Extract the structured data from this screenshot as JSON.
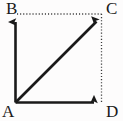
{
  "figure": {
    "name": "vector-parallelogram-diagram",
    "width": 123,
    "height": 121,
    "background_color": "#fdfcfc",
    "stroke_color": "#1a1a1a"
  },
  "labels": {
    "a": "A",
    "b": "B",
    "c": "C",
    "d": "D"
  },
  "points": {
    "a": {
      "name": "A",
      "x": 15,
      "y": 102
    },
    "b": {
      "name": "B",
      "x": 15,
      "y": 14
    },
    "c": {
      "name": "C",
      "x": 101,
      "y": 14
    },
    "d": {
      "name": "D",
      "x": 101,
      "y": 102
    }
  },
  "vectors": [
    {
      "name": "vector-ab",
      "from": "A",
      "to": "B",
      "style": "solid-arrow",
      "direction": "up"
    },
    {
      "name": "vector-ac",
      "from": "A",
      "to": "C",
      "style": "solid-arrow",
      "direction": "up-right"
    },
    {
      "name": "vector-ad",
      "from": "A",
      "to": "D",
      "style": "solid-arrow",
      "direction": "right"
    }
  ],
  "guides": [
    {
      "name": "guide-bc",
      "from": "B",
      "to": "C",
      "style": "dotted"
    },
    {
      "name": "guide-cd",
      "from": "C",
      "to": "D",
      "style": "dotted"
    }
  ]
}
